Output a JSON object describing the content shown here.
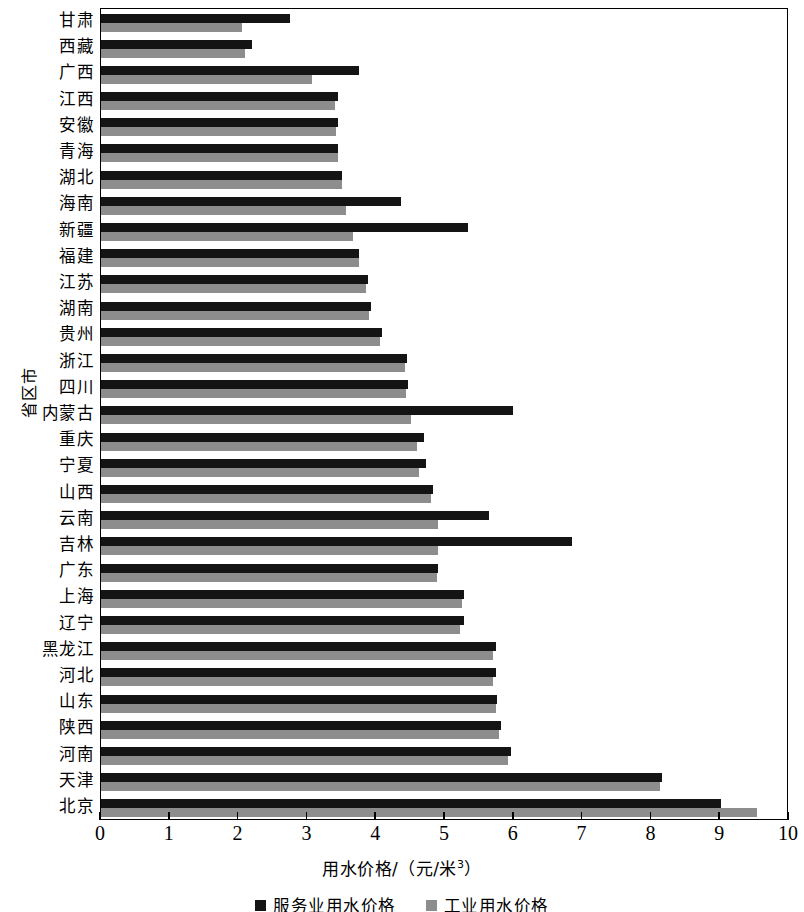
{
  "chart_data": {
    "type": "bar",
    "orientation": "horizontal",
    "title": "",
    "xlabel": "用水价格/（元/米³）",
    "ylabel": "省区市",
    "xlim": [
      0,
      10
    ],
    "xticks": [
      0,
      1,
      2,
      3,
      4,
      5,
      6,
      7,
      8,
      9,
      10
    ],
    "xtick_labels": [
      "0",
      "1",
      "2",
      "3",
      "4",
      "5",
      "6",
      "7",
      "8",
      "9",
      "10"
    ],
    "grid": false,
    "legend_position": "bottom",
    "categories": [
      "甘肃",
      "西藏",
      "广西",
      "江西",
      "安徽",
      "青海",
      "湖北",
      "海南",
      "新疆",
      "福建",
      "江苏",
      "湖南",
      "贵州",
      "浙江",
      "四川",
      "内蒙古",
      "重庆",
      "宁夏",
      "山西",
      "云南",
      "吉林",
      "广东",
      "上海",
      "辽宁",
      "黑龙江",
      "河北",
      "山东",
      "陕西",
      "河南",
      "天津",
      "北京"
    ],
    "series": [
      {
        "name": "服务业用水价格",
        "color": "#141414",
        "values": [
          2.75,
          2.2,
          3.75,
          3.44,
          3.44,
          3.45,
          3.5,
          4.36,
          5.33,
          3.75,
          3.88,
          3.92,
          4.08,
          4.45,
          4.46,
          5.99,
          4.7,
          4.72,
          4.82,
          5.64,
          6.85,
          4.9,
          5.28,
          5.28,
          5.74,
          5.74,
          5.76,
          5.81,
          5.96,
          8.15,
          9.01
        ]
      },
      {
        "name": "工业用水价格",
        "color": "#8d8d8d",
        "values": [
          2.05,
          2.1,
          3.07,
          3.4,
          3.42,
          3.45,
          3.5,
          3.56,
          3.66,
          3.75,
          3.85,
          3.9,
          4.06,
          4.42,
          4.44,
          4.51,
          4.59,
          4.62,
          4.8,
          4.9,
          4.9,
          4.88,
          5.24,
          5.22,
          5.7,
          5.7,
          5.74,
          5.78,
          5.92,
          8.12,
          9.53
        ]
      }
    ]
  },
  "legend": {
    "items": [
      {
        "label": "服务业用水价格",
        "color": "#141414"
      },
      {
        "label": "工业用水价格",
        "color": "#8d8d8d"
      }
    ]
  },
  "axis": {
    "x_title_main": "用水价格/（元/米",
    "x_title_sup": "3",
    "x_title_tail": "）",
    "y_title": "省区市"
  }
}
